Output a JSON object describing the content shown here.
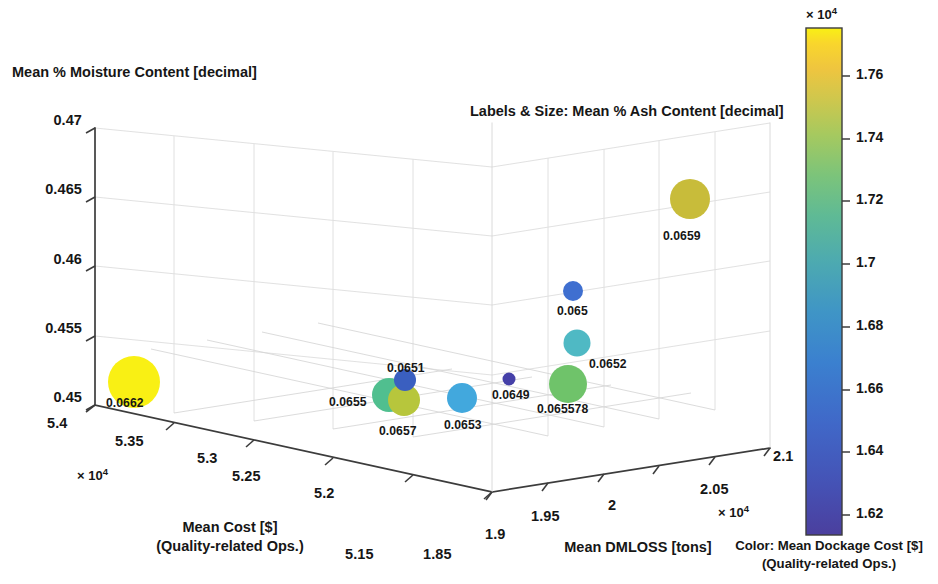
{
  "chart_data": {
    "type": "scatter",
    "subtype": "3d-bubble",
    "title": "Labels & Size: Mean % Ash Content [decimal]",
    "xlabel": "Mean Cost [$]\n(Quality-related Ops.)",
    "xlabel_line1": "Mean Cost [$]",
    "xlabel_line2": "(Quality-related Ops.)",
    "ylabel": "Mean DMLOSS [tons]",
    "zlabel": "Mean % Moisture Content [decimal]",
    "x_exponent": "× 10",
    "x_exponent_sup": "4",
    "y_exponent": "× 10",
    "y_exponent_sup": "4",
    "x_ticks": [
      "5.4",
      "5.35",
      "5.3",
      "5.25",
      "5.2",
      "5.15"
    ],
    "x_tick_values": [
      54000,
      53500,
      53000,
      52500,
      52000,
      51500
    ],
    "y_ticks": [
      "1.85",
      "1.9",
      "1.95",
      "2",
      "2.05",
      "2.1"
    ],
    "y_tick_values": [
      18500,
      19000,
      19500,
      20000,
      20500,
      21000
    ],
    "z_ticks": [
      "0.47",
      "0.465",
      "0.46",
      "0.455",
      "0.45"
    ],
    "z_tick_values": [
      0.47,
      0.465,
      0.46,
      0.455,
      0.45
    ],
    "xlim": [
      51500,
      54000
    ],
    "ylim": [
      18500,
      21000
    ],
    "zlim": [
      0.45,
      0.47
    ],
    "grid": true,
    "legend": "none",
    "colormap": "parula",
    "colorbar": {
      "label_line1": "Color: Mean Dockage Cost [$]",
      "label_line2": "(Quality-related Ops.)",
      "exponent": "× 10",
      "exponent_sup": "4",
      "ticks": [
        "1.76",
        "1.74",
        "1.72",
        "1.7",
        "1.68",
        "1.66",
        "1.64",
        "1.62"
      ],
      "tick_values": [
        17600,
        17400,
        17200,
        17000,
        16800,
        16600,
        16400,
        16200
      ],
      "range": [
        16100,
        17750
      ]
    },
    "points": [
      {
        "label": "0.0662",
        "ash": 0.0662,
        "color": "#f9f014",
        "dockage_cost": 17720,
        "px": 134,
        "py": 382,
        "r": 26
      },
      {
        "label": "0.0659",
        "ash": 0.0659,
        "color": "#c8bc3a",
        "dockage_cost": 17420,
        "px": 690,
        "py": 199,
        "r": 20
      },
      {
        "label": "0.065",
        "ash": 0.065,
        "color": "#3f6fd0",
        "dockage_cost": 16510,
        "px": 573,
        "py": 291,
        "r": 10
      },
      {
        "label": "0.0652",
        "ash": 0.0652,
        "color": "#4fb9c4",
        "dockage_cost": 16950,
        "px": 577,
        "py": 343,
        "r": 13.5
      },
      {
        "label": "0.065578",
        "ash": 0.065578,
        "color": "#6fc36a",
        "dockage_cost": 17180,
        "px": 568,
        "py": 384,
        "r": 19
      },
      {
        "label": "0.0649",
        "ash": 0.0649,
        "color": "#4540a8",
        "dockage_cost": 16180,
        "px": 509,
        "py": 379,
        "r": 6.5
      },
      {
        "label": "0.0653",
        "ash": 0.0653,
        "color": "#42a8dd",
        "dockage_cost": 16830,
        "px": 462,
        "py": 398,
        "r": 15
      },
      {
        "label": "0.0655",
        "ash": 0.0655,
        "color": "#50bf8f",
        "dockage_cost": 17090,
        "px": 389,
        "py": 395,
        "r": 17
      },
      {
        "label": "0.0657",
        "ash": 0.0657,
        "color": "#b7c63c",
        "dockage_cost": 17320,
        "px": 404,
        "py": 400,
        "r": 16
      },
      {
        "label": "0.0651",
        "ash": 0.0651,
        "color": "#3a5fc0",
        "dockage_cost": 16450,
        "px": 405,
        "py": 380,
        "r": 11
      }
    ],
    "point_labels": [
      {
        "text": "0.0662",
        "px": 106,
        "py": 397
      },
      {
        "text": "0.0659",
        "px": 663,
        "py": 230
      },
      {
        "text": "0.065",
        "px": 557,
        "py": 305
      },
      {
        "text": "0.0652",
        "px": 589,
        "py": 358
      },
      {
        "text": "0.065578",
        "px": 537,
        "py": 403
      },
      {
        "text": "0.0649",
        "px": 492,
        "py": 389
      },
      {
        "text": "0.0653",
        "px": 444,
        "py": 419
      },
      {
        "text": "0.0655",
        "px": 329,
        "py": 396
      },
      {
        "text": "0.0657",
        "px": 379,
        "py": 425
      },
      {
        "text": "0.0651",
        "px": 387,
        "py": 362
      }
    ]
  }
}
